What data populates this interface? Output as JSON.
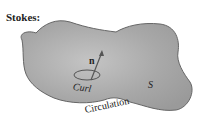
{
  "title": "Stokes:",
  "labels": {
    "normal": "n",
    "curl": "Curl",
    "surface": "S",
    "circulation": "Circulation"
  },
  "colors": {
    "surface_fill": "#a9a9a9",
    "boundary": "#666666",
    "background": "#ffffff"
  }
}
